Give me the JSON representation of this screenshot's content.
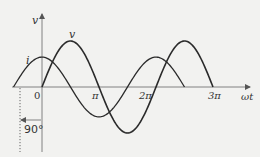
{
  "diagram": {
    "axis_labels": {
      "y": "v",
      "x": "ωt",
      "origin": "0"
    },
    "ticks": [
      {
        "label": "π",
        "value_pi": 1
      },
      {
        "label": "2π",
        "value_pi": 2
      },
      {
        "label": "3π",
        "value_pi": 3
      }
    ],
    "curves": [
      {
        "name": "v",
        "label": "v",
        "amplitude": 1.0,
        "phase_deg": 0,
        "start_pi": 0,
        "end_pi": 3
      },
      {
        "name": "i",
        "label": "i",
        "amplitude": 0.65,
        "phase_deg": 90,
        "start_pi": -0.5,
        "end_pi": 2.5
      }
    ],
    "phase_annotation": "90°",
    "colors": {
      "background": "#f2f2f0",
      "line": "#333333",
      "axis": "#555555"
    }
  }
}
